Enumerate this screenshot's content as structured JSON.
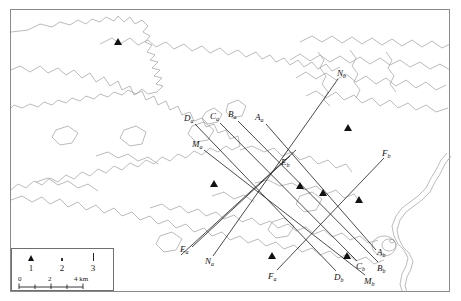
{
  "figure": {
    "type": "map"
  },
  "transect_labels": [
    {
      "id": "Da",
      "base": "D",
      "sub": "a",
      "x": 188,
      "y": 118
    },
    {
      "id": "Ca",
      "base": "C",
      "sub": "a",
      "x": 214,
      "y": 116
    },
    {
      "id": "Ba",
      "base": "B",
      "sub": "a",
      "x": 231,
      "y": 114
    },
    {
      "id": "Aa",
      "base": "A",
      "sub": "a",
      "x": 259,
      "y": 117
    },
    {
      "id": "Ma",
      "base": "M",
      "sub": "a",
      "x": 196,
      "y": 144
    },
    {
      "id": "Nb",
      "base": "N",
      "sub": "b",
      "x": 341,
      "y": 72
    },
    {
      "id": "Fb",
      "base": "F",
      "sub": "b",
      "x": 386,
      "y": 153
    },
    {
      "id": "Eb",
      "base": "E",
      "sub": "b",
      "x": 285,
      "y": 162
    },
    {
      "id": "Ea",
      "base": "E",
      "sub": "a",
      "x": 185,
      "y": 249
    },
    {
      "id": "Na",
      "base": "N",
      "sub": "a",
      "x": 209,
      "y": 261
    },
    {
      "id": "Fa",
      "base": "F",
      "sub": "a",
      "x": 272,
      "y": 276
    },
    {
      "id": "Db",
      "base": "D",
      "sub": "b",
      "x": 338,
      "y": 277
    },
    {
      "id": "Mb",
      "base": "M",
      "sub": "b",
      "x": 368,
      "y": 281
    },
    {
      "id": "Cb",
      "base": "C",
      "sub": "b",
      "x": 360,
      "y": 266
    },
    {
      "id": "Bb",
      "base": "B",
      "sub": "b",
      "x": 381,
      "y": 268
    },
    {
      "id": "Ab",
      "base": "A",
      "sub": "b",
      "x": 381,
      "y": 252
    }
  ],
  "transect_lines": [
    {
      "id": "A",
      "from": [
        266,
        124
      ],
      "to": [
        376,
        250
      ]
    },
    {
      "id": "B",
      "from": [
        238,
        121
      ],
      "to": [
        378,
        262
      ]
    },
    {
      "id": "C",
      "from": [
        220,
        123
      ],
      "to": [
        357,
        261
      ]
    },
    {
      "id": "D",
      "from": [
        195,
        124
      ],
      "to": [
        336,
        271
      ]
    },
    {
      "id": "M",
      "from": [
        204,
        150
      ],
      "to": [
        365,
        275
      ]
    },
    {
      "id": "E",
      "from": [
        288,
        157
      ],
      "to": [
        192,
        248
      ]
    },
    {
      "id": "Elong",
      "from": [
        295,
        150
      ],
      "to": [
        180,
        256
      ]
    },
    {
      "id": "N",
      "from": [
        338,
        79
      ],
      "to": [
        213,
        256
      ]
    },
    {
      "id": "F",
      "from": [
        384,
        158
      ],
      "to": [
        277,
        270
      ]
    }
  ],
  "station_markers": [
    {
      "x": 300,
      "y": 186
    },
    {
      "x": 323,
      "y": 193
    },
    {
      "x": 359,
      "y": 200
    },
    {
      "x": 214,
      "y": 184
    },
    {
      "x": 272,
      "y": 256
    },
    {
      "x": 118,
      "y": 42
    },
    {
      "x": 348,
      "y": 128
    },
    {
      "x": 347,
      "y": 256
    }
  ],
  "legend": {
    "symbols": [
      {
        "number": "1",
        "symbol": "triangle",
        "name": "triangle-symbol"
      },
      {
        "number": "2",
        "symbol": "square",
        "name": "square-symbol"
      },
      {
        "number": "3",
        "symbol": "line",
        "name": "line-symbol"
      }
    ],
    "scale": {
      "ticks": [
        "0",
        "2",
        "4"
      ],
      "unit": "km",
      "label_0": "0",
      "label_2": "2",
      "label_4": "4 km"
    }
  },
  "colors": {
    "frame": "#8a8a8a",
    "coastline": "#9a9a9a",
    "line": "#2b2b2b",
    "marker": "#111111"
  }
}
